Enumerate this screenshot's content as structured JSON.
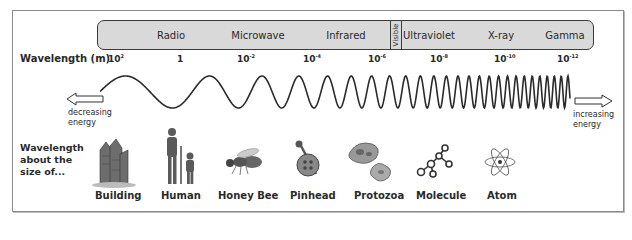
{
  "diagram": {
    "bands": [
      {
        "name": "Radio",
        "center_x": 170
      },
      {
        "name": "Microwave",
        "center_x": 257
      },
      {
        "name": "Infrared",
        "center_x": 345
      },
      {
        "name": "Visible",
        "center_x": 395
      },
      {
        "name": "Ultraviolet",
        "center_x": 428
      },
      {
        "name": "X-ray",
        "center_x": 500
      },
      {
        "name": "Gamma",
        "center_x": 565
      }
    ],
    "wavelength_axis": {
      "label": "Wavelength (m)",
      "ticks": [
        {
          "base": "10",
          "exp": "2",
          "x": 108
        },
        {
          "base": "1",
          "exp": "",
          "x": 177
        },
        {
          "base": "10",
          "exp": "-2",
          "x": 240
        },
        {
          "base": "10",
          "exp": "-4",
          "x": 306
        },
        {
          "base": "10",
          "exp": "-6",
          "x": 371
        },
        {
          "base": "10",
          "exp": "-8",
          "x": 433
        },
        {
          "base": "10",
          "exp": "-10",
          "x": 497
        },
        {
          "base": "10",
          "exp": "-12",
          "x": 560
        }
      ]
    },
    "energy": {
      "left_label_line1": "decreasing",
      "left_label_line2": "energy",
      "right_label_line1": "increasing",
      "right_label_line2": "energy"
    },
    "size_comparison": {
      "label_line1": "Wavelength",
      "label_line2": "about the",
      "label_line3": "size of...",
      "objects": [
        {
          "name": "Building",
          "icon": "building-icon",
          "x": 114
        },
        {
          "name": "Human",
          "icon": "human-icon",
          "x": 178
        },
        {
          "name": "Honey Bee",
          "icon": "honey-bee-icon",
          "x": 244
        },
        {
          "name": "Pinhead",
          "icon": "pinhead-icon",
          "x": 308
        },
        {
          "name": "Protozoa",
          "icon": "protozoa-icon",
          "x": 372
        },
        {
          "name": "Molecule",
          "icon": "molecule-icon",
          "x": 437
        },
        {
          "name": "Atom",
          "icon": "atom-icon",
          "x": 500
        }
      ]
    }
  }
}
